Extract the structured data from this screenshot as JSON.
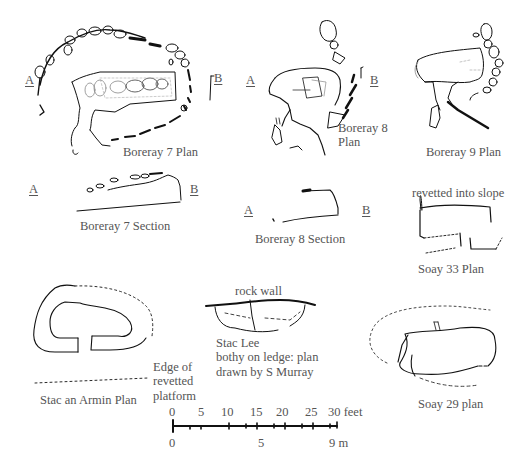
{
  "figure": {
    "drawings": [
      {
        "id": "boreray-7-plan",
        "label": "Boreray 7 Plan",
        "section_markers": [
          "A",
          "B"
        ]
      },
      {
        "id": "boreray-8-plan",
        "label": "Boreray 8\nPlan",
        "section_markers": [
          "A",
          "B"
        ]
      },
      {
        "id": "boreray-9-plan",
        "label": "Boreray 9 Plan"
      },
      {
        "id": "boreray-7-section",
        "label": "Boreray 7 Section",
        "section_markers": [
          "A",
          "B"
        ]
      },
      {
        "id": "boreray-8-section",
        "label": "Boreray 8 Section",
        "section_markers": [
          "A",
          "B"
        ]
      },
      {
        "id": "soay-33-plan",
        "label": "Soay 33 Plan",
        "annotation": "revetted into slope"
      },
      {
        "id": "stac-an-armin-plan",
        "label": "Stac an Armin Plan",
        "annotation": "Edge of\nrevetted\nplatform"
      },
      {
        "id": "stac-lee-plan",
        "label": "Stac Lee\nbothy on ledge: plan\ndrawn by S Murray",
        "annotation": "rock wall"
      },
      {
        "id": "soay-29-plan",
        "label": "Soay 29 plan"
      }
    ],
    "scale_bar": {
      "feet_ticks": [
        "0",
        "5",
        "10",
        "15",
        "20",
        "25",
        "30"
      ],
      "feet_unit": "feet",
      "metre_ticks": [
        "0",
        "5",
        "9"
      ],
      "metre_unit": "m",
      "last_feet_label": "30 feet",
      "last_metre_label": "9 m"
    }
  }
}
